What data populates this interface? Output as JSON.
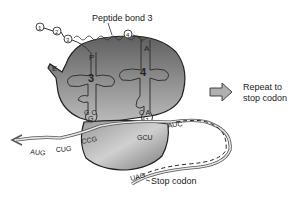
{
  "diagram": {
    "labels": {
      "peptide_bond": "Peptide bond 3",
      "repeat": [
        "Repeat to",
        "stop codon"
      ],
      "stop_codon": "Stop codon"
    },
    "amino_acids": [
      "1",
      "2",
      "3",
      "4"
    ],
    "sites": {
      "exit": "E",
      "p_site": "P",
      "a_site": "A"
    },
    "trnas": [
      {
        "number": "3",
        "site": "P",
        "anticodon_top": "G C",
        "anticodon_mid": "G"
      },
      {
        "number": "4",
        "site": "A",
        "anticodon_top": "C A",
        "anticodon_mid": "G"
      }
    ],
    "mrna": {
      "codons_left": [
        "AUG",
        "CUG"
      ],
      "codon_p": "CCG",
      "codon_a": "GCU",
      "codon_next": "AUC",
      "stop": "UAG"
    },
    "colors": {
      "ribosome_dark": "#6e6e6e",
      "ribosome_light": "#c8c8c8",
      "outline": "#222222",
      "arrow_fill": "#b0b0b0"
    }
  }
}
